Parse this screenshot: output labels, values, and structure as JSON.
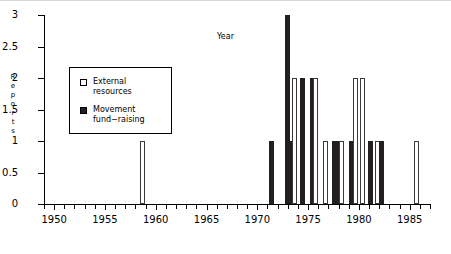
{
  "chart_data": {
    "type": "bar",
    "title": "",
    "xlabel": "Year",
    "ylabel": "Reports",
    "xlim": [
      1949,
      1987
    ],
    "ylim": [
      0,
      3
    ],
    "ytick_labels": [
      "0",
      "0.5",
      "1",
      "1.5",
      "2",
      "2.5",
      "3"
    ],
    "ytick_values": [
      0,
      0.5,
      1,
      1.5,
      2,
      2.5,
      3
    ],
    "xtick_labels": [
      "1950",
      "1955",
      "1960",
      "1965",
      "1970",
      "1975",
      "1980",
      "1985"
    ],
    "xtick_values": [
      1950,
      1955,
      1960,
      1965,
      1970,
      1975,
      1980,
      1985
    ],
    "minor_tick_step": 1,
    "grid": false,
    "legend_position": "upper left",
    "series": [
      {
        "name": "External resources",
        "key": "external",
        "color": "#ffffff",
        "edge_color": "#3b3b3b",
        "points": [
          {
            "x": 1958.7,
            "y": 1
          },
          {
            "x": 1973.7,
            "y": 2
          },
          {
            "x": 1975.7,
            "y": 2
          },
          {
            "x": 1976.7,
            "y": 1
          },
          {
            "x": 1978.3,
            "y": 1
          },
          {
            "x": 1979.7,
            "y": 2
          },
          {
            "x": 1980.4,
            "y": 2
          },
          {
            "x": 1981.8,
            "y": 1
          },
          {
            "x": 1985.7,
            "y": 1
          }
        ]
      },
      {
        "name": "Movement fund-raising",
        "key": "movement",
        "color": "#231f20",
        "edge_color": "#231f20",
        "points": [
          {
            "x": 1971.4,
            "y": 1
          },
          {
            "x": 1973.0,
            "y": 3
          },
          {
            "x": 1973.4,
            "y": 1
          },
          {
            "x": 1974.4,
            "y": 2
          },
          {
            "x": 1975.4,
            "y": 2
          },
          {
            "x": 1977.6,
            "y": 1
          },
          {
            "x": 1978.0,
            "y": 1
          },
          {
            "x": 1979.3,
            "y": 1
          },
          {
            "x": 1981.1,
            "y": 1
          },
          {
            "x": 1982.2,
            "y": 1
          }
        ]
      }
    ]
  },
  "axes": {
    "y_title": "Reports",
    "x_title": "Year"
  },
  "legend": {
    "entries": [
      {
        "label": "External\nresources",
        "swatch": "external-swatch-icon"
      },
      {
        "label": "Movement\nfund−raising",
        "swatch": "movement-swatch-icon"
      }
    ]
  }
}
